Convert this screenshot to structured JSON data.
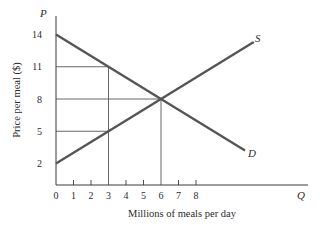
{
  "chart_data": {
    "type": "line",
    "title": "",
    "xlabel": "Millions of meals per day",
    "ylabel": "Price per meal ($)",
    "x_axis_symbol": "Q",
    "y_axis_symbol": "P",
    "xlim": [
      0,
      15
    ],
    "ylim": [
      0,
      15.5
    ],
    "x_ticks": [
      0,
      1,
      2,
      3,
      4,
      5,
      6,
      7,
      8
    ],
    "x_tick_labels": [
      "0",
      "1",
      "2",
      "3",
      "4",
      "5",
      "6",
      "7",
      "8"
    ],
    "y_ticks": [
      2,
      5,
      8,
      11,
      14
    ],
    "y_tick_labels": [
      "2",
      "5",
      "8",
      "11",
      "14"
    ],
    "grid": false,
    "series": [
      {
        "name": "S",
        "label": "Supply",
        "x": [
          0,
          3,
          6,
          11.3
        ],
        "y": [
          2,
          5,
          8,
          13.3
        ]
      },
      {
        "name": "D",
        "label": "Demand",
        "x": [
          0,
          3,
          6,
          10.8
        ],
        "y": [
          14,
          11,
          8,
          3.2
        ]
      }
    ],
    "reference_lines": [
      {
        "type": "horizontal",
        "y": 11,
        "x_from": 0,
        "x_to": 3
      },
      {
        "type": "horizontal",
        "y": 8,
        "x_from": 0,
        "x_to": 6
      },
      {
        "type": "horizontal",
        "y": 5,
        "x_from": 0,
        "x_to": 3
      },
      {
        "type": "vertical",
        "x": 3,
        "y_from": 0,
        "y_to": 11
      },
      {
        "type": "vertical",
        "x": 6,
        "y_from": 0,
        "y_to": 8
      }
    ],
    "equilibrium": {
      "q": 6,
      "p": 8
    },
    "annotations": [
      "S",
      "D"
    ]
  }
}
